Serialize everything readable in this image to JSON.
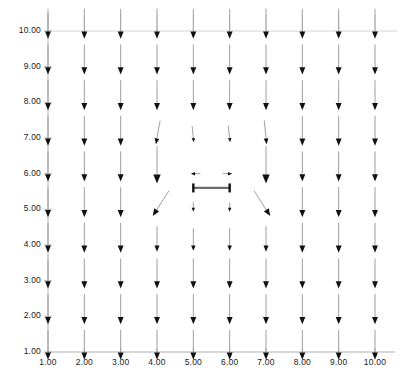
{
  "chart_data": {
    "type": "scatter",
    "subtype": "quiver-vector-field",
    "title": "",
    "subtitle": "",
    "xlabel": "",
    "ylabel": "",
    "xlim": [
      1,
      10
    ],
    "ylim": [
      1,
      10
    ],
    "grid": true,
    "legend": "none",
    "x_ticks": [
      1,
      2,
      3,
      4,
      5,
      6,
      7,
      8,
      9,
      10
    ],
    "y_ticks": [
      1,
      2,
      3,
      4,
      5,
      6,
      7,
      8,
      9,
      10
    ],
    "x_tick_labels": [
      "1.00",
      "2.00",
      "3.00",
      "4.00",
      "5.00",
      "6.00",
      "7.00",
      "8.00",
      "9.00",
      "10.00"
    ],
    "y_tick_labels": [
      "1.00",
      "2.00",
      "3.00",
      "4.00",
      "5.00",
      "6.00",
      "7.00",
      "8.00",
      "9.00",
      "10.00"
    ],
    "arrow_color": "#111111",
    "shaft_color": "#9a9a9a",
    "grid_color": "#c9c9c9",
    "axis_color": "#a8a8a8",
    "obstacle": {
      "label": "horizontal-barrier",
      "x_start": 5.0,
      "x_end": 6.0,
      "y": 5.6,
      "color": "#6e6e6e"
    },
    "vectors": [
      {
        "x": 1,
        "y": 1,
        "u": 0,
        "v": -1,
        "mag": 1.0
      },
      {
        "x": 2,
        "y": 1,
        "u": 0,
        "v": -1,
        "mag": 1.0
      },
      {
        "x": 3,
        "y": 1,
        "u": 0,
        "v": -1,
        "mag": 1.0
      },
      {
        "x": 4,
        "y": 1,
        "u": 0,
        "v": -1,
        "mag": 1.0
      },
      {
        "x": 5,
        "y": 1,
        "u": 0,
        "v": -1,
        "mag": 1.0
      },
      {
        "x": 6,
        "y": 1,
        "u": 0,
        "v": -1,
        "mag": 1.0
      },
      {
        "x": 7,
        "y": 1,
        "u": 0,
        "v": -1,
        "mag": 1.0
      },
      {
        "x": 8,
        "y": 1,
        "u": 0,
        "v": -1,
        "mag": 1.0
      },
      {
        "x": 9,
        "y": 1,
        "u": 0,
        "v": -1,
        "mag": 1.0
      },
      {
        "x": 10,
        "y": 1,
        "u": 0,
        "v": -1,
        "mag": 1.0
      },
      {
        "x": 1,
        "y": 2,
        "u": 0,
        "v": -1,
        "mag": 1.0
      },
      {
        "x": 2,
        "y": 2,
        "u": 0,
        "v": -1,
        "mag": 1.0
      },
      {
        "x": 3,
        "y": 2,
        "u": 0,
        "v": -1,
        "mag": 1.0
      },
      {
        "x": 4,
        "y": 2,
        "u": 0,
        "v": -1,
        "mag": 1.0
      },
      {
        "x": 5,
        "y": 2,
        "u": 0,
        "v": -1,
        "mag": 1.0
      },
      {
        "x": 6,
        "y": 2,
        "u": 0,
        "v": -1,
        "mag": 1.0
      },
      {
        "x": 7,
        "y": 2,
        "u": 0,
        "v": -1,
        "mag": 1.0
      },
      {
        "x": 8,
        "y": 2,
        "u": 0,
        "v": -1,
        "mag": 1.0
      },
      {
        "x": 9,
        "y": 2,
        "u": 0,
        "v": -1,
        "mag": 1.0
      },
      {
        "x": 10,
        "y": 2,
        "u": 0,
        "v": -1,
        "mag": 1.0
      },
      {
        "x": 1,
        "y": 3,
        "u": 0,
        "v": -1,
        "mag": 1.0
      },
      {
        "x": 2,
        "y": 3,
        "u": 0,
        "v": -1,
        "mag": 1.0
      },
      {
        "x": 3,
        "y": 3,
        "u": 0,
        "v": -1,
        "mag": 1.0
      },
      {
        "x": 4,
        "y": 3,
        "u": 0,
        "v": -1,
        "mag": 1.0
      },
      {
        "x": 5,
        "y": 3,
        "u": 0,
        "v": -1,
        "mag": 1.0
      },
      {
        "x": 6,
        "y": 3,
        "u": 0,
        "v": -1,
        "mag": 1.0
      },
      {
        "x": 7,
        "y": 3,
        "u": 0,
        "v": -1,
        "mag": 1.0
      },
      {
        "x": 8,
        "y": 3,
        "u": 0,
        "v": -1,
        "mag": 1.0
      },
      {
        "x": 9,
        "y": 3,
        "u": 0,
        "v": -1,
        "mag": 1.0
      },
      {
        "x": 10,
        "y": 3,
        "u": 0,
        "v": -1,
        "mag": 1.0
      },
      {
        "x": 1,
        "y": 4,
        "u": 0,
        "v": -1,
        "mag": 1.0
      },
      {
        "x": 2,
        "y": 4,
        "u": 0,
        "v": -1,
        "mag": 1.0
      },
      {
        "x": 3,
        "y": 4,
        "u": 0,
        "v": -1,
        "mag": 1.0
      },
      {
        "x": 4,
        "y": 4,
        "u": 0,
        "v": -1,
        "mag": 0.85
      },
      {
        "x": 5,
        "y": 4,
        "u": 0,
        "v": -1,
        "mag": 0.75
      },
      {
        "x": 6,
        "y": 4,
        "u": 0,
        "v": -1,
        "mag": 0.75
      },
      {
        "x": 7,
        "y": 4,
        "u": 0,
        "v": -1,
        "mag": 0.85
      },
      {
        "x": 8,
        "y": 4,
        "u": 0,
        "v": -1,
        "mag": 1.0
      },
      {
        "x": 9,
        "y": 4,
        "u": 0,
        "v": -1,
        "mag": 1.0
      },
      {
        "x": 10,
        "y": 4,
        "u": 0,
        "v": -1,
        "mag": 1.0
      },
      {
        "x": 1,
        "y": 5,
        "u": 0,
        "v": -1,
        "mag": 1.0
      },
      {
        "x": 2,
        "y": 5,
        "u": 0,
        "v": -1,
        "mag": 1.0
      },
      {
        "x": 3,
        "y": 5,
        "u": 0,
        "v": -1,
        "mag": 1.0
      },
      {
        "x": 4,
        "y": 5,
        "u": -0.55,
        "v": -0.85,
        "mag": 1.0
      },
      {
        "x": 5,
        "y": 5,
        "u": 0,
        "v": -1,
        "mag": 0.32
      },
      {
        "x": 6,
        "y": 5,
        "u": 0,
        "v": -1,
        "mag": 0.32
      },
      {
        "x": 7,
        "y": 5,
        "u": 0.55,
        "v": -0.85,
        "mag": 1.0
      },
      {
        "x": 8,
        "y": 5,
        "u": 0,
        "v": -1,
        "mag": 1.0
      },
      {
        "x": 9,
        "y": 5,
        "u": 0,
        "v": -1,
        "mag": 1.0
      },
      {
        "x": 10,
        "y": 5,
        "u": 0,
        "v": -1,
        "mag": 1.0
      },
      {
        "x": 1,
        "y": 6,
        "u": 0,
        "v": -1,
        "mag": 1.0
      },
      {
        "x": 2,
        "y": 6,
        "u": 0,
        "v": -1,
        "mag": 1.0
      },
      {
        "x": 3,
        "y": 6,
        "u": 0,
        "v": -1,
        "mag": 1.0
      },
      {
        "x": 4,
        "y": 6,
        "u": 0,
        "v": -1,
        "mag": 1.25
      },
      {
        "x": 5,
        "y": 6,
        "u": -1,
        "v": 0,
        "mag": 0.32
      },
      {
        "x": 6,
        "y": 6,
        "u": 1,
        "v": 0,
        "mag": 0.32
      },
      {
        "x": 7,
        "y": 6,
        "u": 0,
        "v": -1,
        "mag": 1.25
      },
      {
        "x": 8,
        "y": 6,
        "u": 0,
        "v": -1,
        "mag": 1.0
      },
      {
        "x": 9,
        "y": 6,
        "u": 0,
        "v": -1,
        "mag": 1.0
      },
      {
        "x": 10,
        "y": 6,
        "u": 0,
        "v": -1,
        "mag": 1.0
      },
      {
        "x": 1,
        "y": 7,
        "u": 0,
        "v": -1,
        "mag": 1.0
      },
      {
        "x": 2,
        "y": 7,
        "u": 0,
        "v": -1,
        "mag": 1.0
      },
      {
        "x": 3,
        "y": 7,
        "u": 0,
        "v": -1,
        "mag": 1.0
      },
      {
        "x": 4,
        "y": 7,
        "u": -0.18,
        "v": -1,
        "mag": 0.8
      },
      {
        "x": 5,
        "y": 7,
        "u": 0.1,
        "v": -1,
        "mag": 0.55
      },
      {
        "x": 6,
        "y": 7,
        "u": 0.12,
        "v": -1,
        "mag": 0.55
      },
      {
        "x": 7,
        "y": 7,
        "u": 0.1,
        "v": -1,
        "mag": 0.8
      },
      {
        "x": 8,
        "y": 7,
        "u": 0,
        "v": -1,
        "mag": 1.0
      },
      {
        "x": 9,
        "y": 7,
        "u": 0,
        "v": -1,
        "mag": 1.0
      },
      {
        "x": 10,
        "y": 7,
        "u": 0,
        "v": -1,
        "mag": 1.0
      },
      {
        "x": 1,
        "y": 8,
        "u": 0,
        "v": -1,
        "mag": 1.0
      },
      {
        "x": 2,
        "y": 8,
        "u": 0,
        "v": -1,
        "mag": 1.0
      },
      {
        "x": 3,
        "y": 8,
        "u": 0,
        "v": -1,
        "mag": 1.0
      },
      {
        "x": 4,
        "y": 8,
        "u": 0,
        "v": -1,
        "mag": 1.0
      },
      {
        "x": 5,
        "y": 8,
        "u": 0,
        "v": -1,
        "mag": 1.0
      },
      {
        "x": 6,
        "y": 8,
        "u": 0,
        "v": -1,
        "mag": 1.0
      },
      {
        "x": 7,
        "y": 8,
        "u": 0,
        "v": -1,
        "mag": 1.0
      },
      {
        "x": 8,
        "y": 8,
        "u": 0,
        "v": -1,
        "mag": 1.0
      },
      {
        "x": 9,
        "y": 8,
        "u": 0,
        "v": -1,
        "mag": 1.0
      },
      {
        "x": 10,
        "y": 8,
        "u": 0,
        "v": -1,
        "mag": 1.0
      },
      {
        "x": 1,
        "y": 9,
        "u": 0,
        "v": -1,
        "mag": 1.0
      },
      {
        "x": 2,
        "y": 9,
        "u": 0,
        "v": -1,
        "mag": 1.0
      },
      {
        "x": 3,
        "y": 9,
        "u": 0,
        "v": -1,
        "mag": 1.0
      },
      {
        "x": 4,
        "y": 9,
        "u": 0,
        "v": -1,
        "mag": 1.0
      },
      {
        "x": 5,
        "y": 9,
        "u": 0,
        "v": -1,
        "mag": 1.0
      },
      {
        "x": 6,
        "y": 9,
        "u": 0,
        "v": -1,
        "mag": 1.0
      },
      {
        "x": 7,
        "y": 9,
        "u": 0,
        "v": -1,
        "mag": 1.0
      },
      {
        "x": 8,
        "y": 9,
        "u": 0,
        "v": -1,
        "mag": 1.0
      },
      {
        "x": 9,
        "y": 9,
        "u": 0,
        "v": -1,
        "mag": 1.0
      },
      {
        "x": 10,
        "y": 9,
        "u": 0,
        "v": -1,
        "mag": 1.0
      },
      {
        "x": 1,
        "y": 10,
        "u": 0,
        "v": -1,
        "mag": 1.0
      },
      {
        "x": 2,
        "y": 10,
        "u": 0,
        "v": -1,
        "mag": 1.0
      },
      {
        "x": 3,
        "y": 10,
        "u": 0,
        "v": -1,
        "mag": 1.0
      },
      {
        "x": 4,
        "y": 10,
        "u": 0,
        "v": -1,
        "mag": 1.0
      },
      {
        "x": 5,
        "y": 10,
        "u": 0,
        "v": -1,
        "mag": 1.0
      },
      {
        "x": 6,
        "y": 10,
        "u": 0,
        "v": -1,
        "mag": 1.0
      },
      {
        "x": 7,
        "y": 10,
        "u": 0,
        "v": -1,
        "mag": 1.0
      },
      {
        "x": 8,
        "y": 10,
        "u": 0,
        "v": -1,
        "mag": 1.0
      },
      {
        "x": 9,
        "y": 10,
        "u": 0,
        "v": -1,
        "mag": 1.0
      },
      {
        "x": 10,
        "y": 10,
        "u": 0,
        "v": -1,
        "mag": 1.0
      }
    ]
  }
}
